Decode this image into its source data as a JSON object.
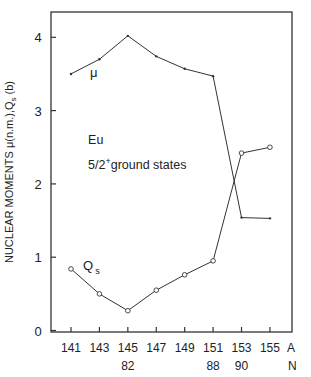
{
  "chart_data": {
    "type": "line",
    "title": "",
    "xlabel": "A",
    "xlabel2": "N",
    "ylabel": "NUCLEAR MOMENTS  μ(n.m.), Qs (b)",
    "ylabel_parts": {
      "main": "NUCLEAR MOMENTS  μ(n.m.),Q",
      "sub": "s",
      "tail": "(b)"
    },
    "x": [
      141,
      143,
      145,
      147,
      149,
      151,
      153,
      155
    ],
    "x_tick_labels": [
      "141",
      "143",
      "145",
      "147",
      "149",
      "151",
      "153",
      "155"
    ],
    "n_tick_labels": [
      {
        "at": 145,
        "label": "82"
      },
      {
        "at": 151,
        "label": "88"
      },
      {
        "at": 153,
        "label": "90"
      }
    ],
    "y_ticks": [
      0,
      1,
      2,
      3,
      4
    ],
    "ylim": [
      0,
      4.35
    ],
    "xlim": [
      139.6,
      156.5
    ],
    "grid": false,
    "series": [
      {
        "name": "μ",
        "label": "μ",
        "marker": "dot",
        "values": [
          3.5,
          3.7,
          4.02,
          3.74,
          3.57,
          3.47,
          1.54,
          1.53
        ]
      },
      {
        "name": "Qs",
        "label": "Q",
        "label_sub": "s",
        "marker": "open-circle",
        "values": [
          0.84,
          0.5,
          0.27,
          0.55,
          0.76,
          0.95,
          2.42,
          2.5
        ]
      }
    ],
    "annotations": [
      {
        "text": "Eu",
        "x": 142.2,
        "y": 2.55
      },
      {
        "text": "5/2",
        "sup": "+",
        "tail": "ground states",
        "x": 142.2,
        "y": 2.2
      }
    ]
  }
}
